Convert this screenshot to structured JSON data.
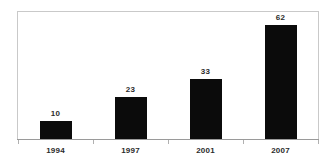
{
  "chart_data": {
    "type": "bar",
    "title": "",
    "subtitle": "",
    "xlabel": "",
    "ylabel": "",
    "categories": [
      "1994",
      "1997",
      "2001",
      "2007"
    ],
    "values": [
      10,
      23,
      33,
      62
    ],
    "data_labels": [
      "10",
      "23",
      "33",
      "62"
    ],
    "series": [
      {
        "name": "",
        "values": [
          10,
          23,
          33,
          62
        ]
      }
    ],
    "ylim": [
      0,
      69
    ],
    "grid": false,
    "legend": false,
    "legend_position": "none",
    "annotations": [],
    "colors": {
      "bar": "#0b0b0b",
      "frame": "#c9c9c9",
      "axis": "#9a9a9a",
      "tick": "#b0b0b0",
      "text": "#2b2b2b",
      "background": "#ffffff"
    }
  }
}
